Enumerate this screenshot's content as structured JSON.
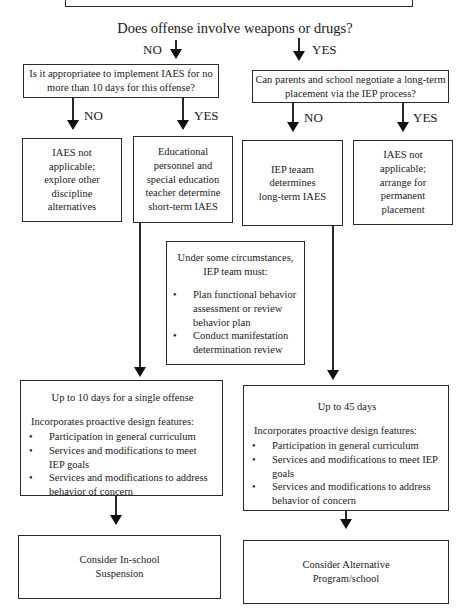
{
  "title": "Does offense involve weapons or drugs?",
  "branches": {
    "no_label": "NO",
    "yes_label": "YES"
  },
  "left_question": {
    "text_line1": "Is it appropriatee to implement IAES for no",
    "text_line2": "more than 10 days for this offense?",
    "no_label": "NO",
    "yes_label": "YES"
  },
  "right_question": {
    "text_line1": "Can parents and school negotiate a long-term",
    "text_line2": "placement via the IEP process?",
    "no_label": "NO",
    "yes_label": "YES"
  },
  "outcomes": {
    "left_no": [
      "IAES not",
      "applicable;",
      "explore other",
      "discipline",
      "alternatives"
    ],
    "left_yes": [
      "Educational",
      "personnel and",
      "special education",
      "teacher determine",
      "short-term IAES"
    ],
    "right_no": [
      "IEP teaam",
      "determines",
      "long-term IAES"
    ],
    "right_yes": [
      "IAES not",
      "applicable;",
      "arrange for",
      "permanent",
      "placement"
    ]
  },
  "middle_box": {
    "heading_line1": "Under some circumstances,",
    "heading_line2": "IEP team must:",
    "items": [
      "Plan functional behavior assessment or review behavior plan",
      "Conduct manifestation determination review"
    ]
  },
  "short_term_box": {
    "heading": "Up to 10 days for a single offense",
    "intro": "Incorporates proactive design features:",
    "items": [
      "Participation in general curriculum",
      "Services and modifications to meet IEP goals",
      "Services and modifications to address behavior of concern"
    ]
  },
  "long_term_box": {
    "heading": "Up to 45 days",
    "intro": "Incorporates proactive design features:",
    "items": [
      "Participation in general curriculum",
      "Services and modifications to meet IEP goals",
      "Services and modifications to address behavior of concern"
    ]
  },
  "final_left": {
    "line1": "Consider In-school",
    "line2": "Suspension"
  },
  "final_right": {
    "line1": "Consider Alternative",
    "line2": "Program/school"
  }
}
